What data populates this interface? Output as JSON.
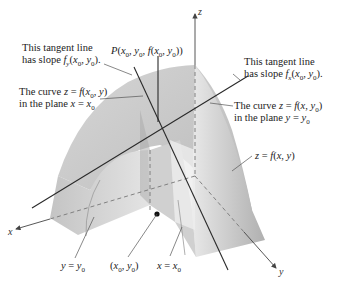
{
  "figure": {
    "type": "3d-surface-partial-derivatives",
    "axes": {
      "x": "x",
      "y": "y",
      "z": "z"
    },
    "labels": {
      "tangent_y_line1": "This tangent line",
      "tangent_y_line2": "has slope f_y(x0, y0).",
      "point_P": "P(x0, y0, f(x0, y0))",
      "tangent_x_line1": "This tangent line",
      "tangent_x_line2": "has slope f_x(x0, y0).",
      "curve_x0_line1": "The curve z = f(x0, y)",
      "curve_x0_line2": "in the plane x = x0",
      "curve_y0_line1": "The curve z = f(x, y0)",
      "curve_y0_line2": "in the plane y = y0",
      "surface": "z = f(x, y)",
      "plane_y0": "y = y0",
      "base_point": "(x0, y0)",
      "plane_x0": "x = x0"
    }
  }
}
